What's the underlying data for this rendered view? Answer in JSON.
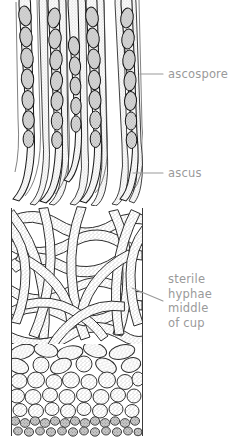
{
  "figure": {
    "background_color": "#ffffff",
    "ink_color": "#1a1a1a",
    "fill_light": "#f2f2f2",
    "label_color": "#9a9a9a",
    "leader_color": "#9a9a9a",
    "width": 243,
    "height": 446
  },
  "labels": [
    {
      "id": "ascospore",
      "text": "ascospore",
      "lines": [
        "ascospore"
      ],
      "x": 168,
      "y": 67,
      "leader": {
        "x1": 140,
        "y1": 74,
        "x2": 163,
        "y2": 74
      }
    },
    {
      "id": "ascus",
      "text": "ascus",
      "lines": [
        "ascus"
      ],
      "x": 168,
      "y": 166,
      "leader": {
        "x1": 133,
        "y1": 173,
        "x2": 163,
        "y2": 173
      }
    },
    {
      "id": "sterile-hyphae",
      "text": "sterile hyphae middle of cup",
      "lines": [
        "sterile",
        "hyphae",
        "middle",
        "of cup"
      ],
      "x": 168,
      "y": 272,
      "leader": {
        "x1": 132,
        "y1": 288,
        "x2": 163,
        "y2": 301
      }
    }
  ],
  "regions": [
    {
      "id": "hymenium",
      "name": "hymenium with asci and ascospores",
      "y_top": 0,
      "y_bottom": 210,
      "description": "palisade of elongate club-shaped asci, each containing a row of dark oval ascospores"
    },
    {
      "id": "sterile-hyphae-layer",
      "name": "sterile hyphae middle of cup",
      "y_top": 210,
      "y_bottom": 345,
      "description": "dense interwoven tangle of stippled filaments"
    },
    {
      "id": "cellular-layer",
      "name": "cellular excipulum",
      "y_top": 345,
      "y_bottom": 440,
      "description": "rounded stippled cells grading into a band of small dark cells at the base"
    }
  ],
  "specimen_bounds": {
    "left": 11,
    "right": 143,
    "top": 0,
    "bottom": 440
  }
}
